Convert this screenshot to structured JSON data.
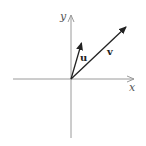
{
  "diagram": {
    "type": "vector-plot",
    "axes": {
      "x_label": "x",
      "y_label": "y",
      "color": "#9a9a9a"
    },
    "vectors": [
      {
        "name": "u",
        "label": "u",
        "color": "#222222"
      },
      {
        "name": "v",
        "label": "v",
        "color": "#222222"
      }
    ]
  }
}
